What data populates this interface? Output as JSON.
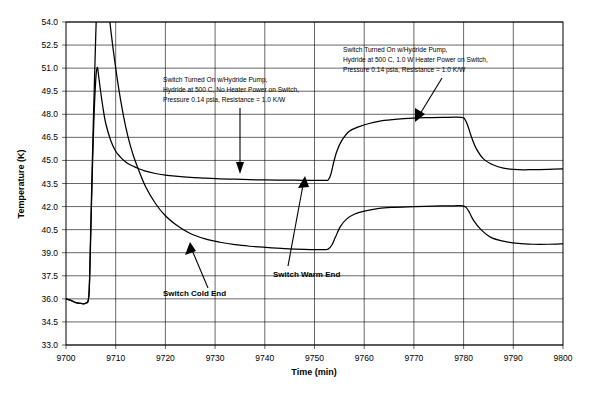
{
  "chart_data": {
    "type": "line",
    "title": "",
    "xlabel": "Time (min)",
    "ylabel": "Temperature (K)",
    "xlim": [
      9700,
      9800
    ],
    "ylim": [
      33.0,
      54.0
    ],
    "xticks": [
      9700,
      9710,
      9720,
      9730,
      9740,
      9750,
      9760,
      9770,
      9780,
      9790,
      9800
    ],
    "yticks": [
      33.0,
      34.5,
      36.0,
      37.5,
      39.0,
      40.5,
      42.0,
      43.5,
      45.0,
      46.5,
      48.0,
      49.5,
      51.0,
      52.5,
      54.0
    ],
    "grid": true,
    "legend": "none",
    "series": [
      {
        "name": "Switch Warm End",
        "x": [
          9700,
          9701,
          9702,
          9703,
          9704,
          9704.6,
          9704.9,
          9705.2,
          9705.6,
          9706,
          9706.3,
          9706.6,
          9707,
          9707.5,
          9708,
          9709,
          9710,
          9711,
          9712,
          9713,
          9714,
          9716,
          9718,
          9720,
          9722,
          9725,
          9728,
          9731,
          9734,
          9737,
          9740,
          9744,
          9748,
          9752,
          9752.8,
          9753.3,
          9753.8,
          9754.5,
          9755.5,
          9757,
          9759,
          9761,
          9764,
          9768,
          9772,
          9776,
          9779.5,
          9780.2,
          9780.8,
          9781.5,
          9782.5,
          9784,
          9786,
          9788,
          9791,
          9794,
          9797,
          9800
        ],
        "y": [
          36.0,
          35.9,
          35.75,
          35.7,
          35.72,
          36.2,
          39.0,
          43.0,
          47.5,
          50.3,
          51.05,
          50.4,
          49.4,
          48.3,
          47.4,
          46.3,
          45.6,
          45.2,
          44.9,
          44.7,
          44.55,
          44.3,
          44.15,
          44.05,
          43.98,
          43.9,
          43.85,
          43.8,
          43.78,
          43.75,
          43.73,
          43.72,
          43.71,
          43.7,
          43.75,
          44.1,
          44.8,
          45.6,
          46.3,
          46.9,
          47.2,
          47.4,
          47.6,
          47.72,
          47.78,
          47.8,
          47.8,
          47.7,
          47.3,
          46.6,
          45.8,
          45.1,
          44.7,
          44.5,
          44.4,
          44.4,
          44.42,
          44.45
        ]
      },
      {
        "name": "Switch Cold End",
        "x": [
          9700,
          9701,
          9702,
          9703,
          9704,
          9704.6,
          9704.9,
          9705.3,
          9705.8,
          9706.3,
          9707,
          9708,
          9709,
          9710,
          9711,
          9712,
          9713,
          9714,
          9716,
          9718,
          9720,
          9722,
          9725,
          9728,
          9731,
          9734,
          9737,
          9740,
          9744,
          9748,
          9752,
          9752.8,
          9753.5,
          9754.2,
          9755.2,
          9756.5,
          9758,
          9760,
          9763,
          9766,
          9770,
          9774,
          9778,
          9779.8,
          9780.5,
          9781.2,
          9782,
          9783.5,
          9785.5,
          9788,
          9791,
          9794,
          9797,
          9800
        ],
        "y": [
          36.0,
          35.9,
          35.75,
          35.7,
          35.72,
          36.2,
          39.5,
          45.0,
          51.0,
          56.0,
          59.0,
          56.5,
          53.5,
          51.0,
          48.9,
          47.2,
          45.9,
          44.9,
          43.3,
          42.2,
          41.4,
          40.85,
          40.25,
          39.9,
          39.68,
          39.52,
          39.42,
          39.35,
          39.27,
          39.22,
          39.2,
          39.25,
          39.5,
          40.0,
          40.7,
          41.2,
          41.5,
          41.7,
          41.88,
          41.95,
          42.0,
          42.03,
          42.05,
          42.05,
          41.95,
          41.6,
          41.1,
          40.5,
          40.0,
          39.75,
          39.6,
          39.55,
          39.55,
          39.58
        ]
      }
    ],
    "annotations": [
      {
        "name": "annotation-left",
        "lines": [
          "Switch Turned On w/Hydride Pump,",
          "Hydride at 500 C, No Heater Power on Switch,",
          "Pressure 0.14 psia, Resistance = 1.0 K/W"
        ]
      },
      {
        "name": "annotation-right",
        "lines": [
          "Switch Turned On w/Hydride Pump,",
          "Hydride at 500 C, 1.0 W Heater Power on Switch,",
          "Pressure 0.14 psia, Resistance = 1.0 K/W"
        ]
      },
      {
        "name": "annotation-cold-end",
        "lines": [
          "Switch Cold End"
        ]
      },
      {
        "name": "annotation-warm-end",
        "lines": [
          "Switch Warm End"
        ]
      }
    ]
  }
}
